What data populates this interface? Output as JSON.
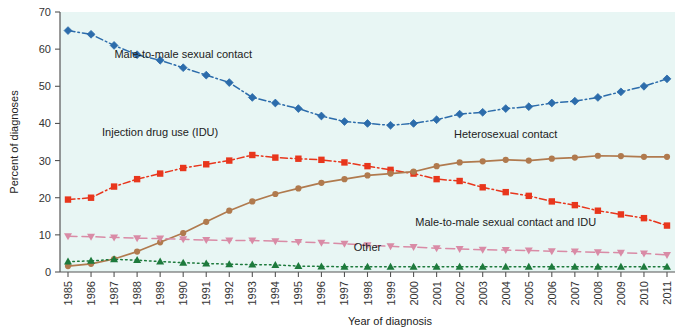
{
  "chart_data": {
    "type": "line",
    "title": "",
    "xlabel": "Year of diagnosis",
    "ylabel": "Percent of diagnoses",
    "ylim": [
      0,
      70
    ],
    "yticks": [
      0,
      10,
      20,
      30,
      40,
      50,
      60,
      70
    ],
    "grid": false,
    "legend_position": "inline-annotations",
    "plot_background": "#e8f6f4",
    "categories": [
      "1985",
      "1986",
      "1987",
      "1988",
      "1989",
      "1990",
      "1991",
      "1992",
      "1993",
      "1994",
      "1995",
      "1996",
      "1997",
      "1998",
      "1999",
      "2000",
      "2001",
      "2002",
      "2003",
      "2004",
      "2005",
      "2006",
      "2007",
      "2008",
      "2009",
      "2010",
      "2011"
    ],
    "series": [
      {
        "name": "Male-to-male sexual contact",
        "color": "#2c6cab",
        "marker": "diamond",
        "dash": "dash-dot",
        "label_x": "1990",
        "label_y": 57.5,
        "values": [
          65.0,
          64.0,
          61.0,
          58.5,
          57.0,
          55.0,
          53.0,
          51.0,
          47.0,
          45.5,
          44.0,
          42.0,
          40.5,
          40.0,
          39.5,
          40.0,
          41.0,
          42.5,
          43.0,
          44.0,
          44.5,
          45.5,
          46.0,
          47.0,
          48.5,
          50.0,
          52.0
        ]
      },
      {
        "name": "Injection drug use (IDU)",
        "color": "#e8361c",
        "marker": "square",
        "dash": "dash-dot",
        "label_x": "1989",
        "label_y": 36.5,
        "values": [
          19.5,
          20.0,
          23.0,
          25.0,
          26.5,
          28.0,
          29.0,
          30.0,
          31.5,
          30.8,
          30.5,
          30.2,
          29.5,
          28.5,
          27.5,
          26.5,
          25.0,
          24.5,
          22.8,
          21.5,
          20.5,
          19.0,
          18.0,
          16.5,
          15.5,
          14.5,
          12.5
        ]
      },
      {
        "name": "Heterosexual contact",
        "color": "#b07a4e",
        "marker": "circle",
        "dash": "solid",
        "label_x": "2004",
        "label_y": 36.0,
        "values": [
          1.6,
          2.2,
          3.5,
          5.5,
          8.0,
          10.5,
          13.5,
          16.5,
          19.0,
          21.0,
          22.5,
          24.0,
          25.0,
          26.0,
          26.5,
          27.0,
          28.5,
          29.5,
          29.8,
          30.2,
          30.0,
          30.5,
          30.8,
          31.3,
          31.2,
          31.0,
          31.0
        ]
      },
      {
        "name": "Male-to-male sexual contact and IDU",
        "color": "#d98ba6",
        "marker": "tri-down",
        "dash": "long-dash",
        "label_x": "2004",
        "label_y": 12.5,
        "values": [
          9.6,
          9.5,
          9.3,
          9.1,
          9.0,
          8.8,
          8.6,
          8.5,
          8.5,
          8.3,
          8.1,
          7.9,
          7.6,
          7.2,
          6.9,
          6.7,
          6.4,
          6.2,
          6.0,
          5.9,
          5.8,
          5.6,
          5.5,
          5.3,
          5.2,
          5.0,
          4.6
        ]
      },
      {
        "name": "Other",
        "color": "#1d7a3c",
        "marker": "tri-up",
        "dash": "dot",
        "label_x": "1998",
        "label_y": 5.6,
        "values": [
          2.8,
          3.0,
          3.4,
          3.2,
          2.8,
          2.5,
          2.3,
          2.1,
          2.0,
          1.9,
          1.6,
          1.5,
          1.4,
          1.4,
          1.4,
          1.4,
          1.4,
          1.4,
          1.4,
          1.4,
          1.4,
          1.4,
          1.4,
          1.4,
          1.4,
          1.4,
          1.4
        ]
      }
    ]
  }
}
